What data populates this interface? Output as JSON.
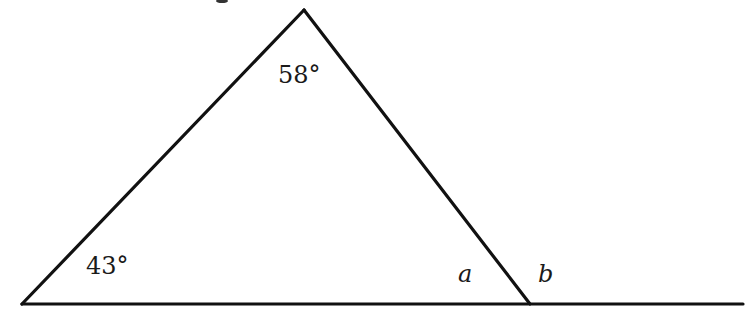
{
  "diagram": {
    "type": "triangle-exterior-angle",
    "line_color": "#111111",
    "background": "#ffffff",
    "vertices": {
      "apex": {
        "x": 304,
        "y": 10
      },
      "bottom_left": {
        "x": 22,
        "y": 304
      },
      "bottom_right": {
        "x": 530,
        "y": 304
      }
    },
    "baseline_extension_end": {
      "x": 743,
      "y": 304
    },
    "labels": {
      "apex_angle": "58°",
      "bottom_left_angle": "43°",
      "interior_angle_var": "a",
      "exterior_angle_var": "b"
    }
  }
}
